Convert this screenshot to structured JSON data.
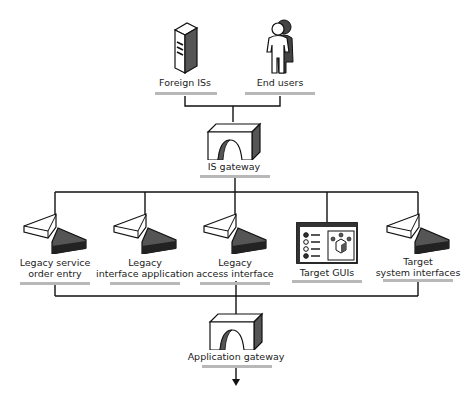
{
  "diagram": {
    "top_nodes": [
      {
        "id": "foreign-iss",
        "label": "Foreign ISs",
        "icon": "server-tower-icon"
      },
      {
        "id": "end-users",
        "label": "End users",
        "icon": "user-person-icon"
      }
    ],
    "is_gateway": {
      "label": "IS gateway",
      "icon": "gateway-arch-icon"
    },
    "middle_nodes": [
      {
        "id": "legacy-service-order-entry",
        "line1": "Legacy service",
        "line2": "order entry",
        "icon": "legacy-interface-icon"
      },
      {
        "id": "legacy-interface-application",
        "line1": "Legacy",
        "line2": "interface application",
        "icon": "legacy-interface-icon"
      },
      {
        "id": "legacy-access-interface",
        "line1": "Legacy",
        "line2": "access interface",
        "icon": "legacy-interface-icon"
      },
      {
        "id": "target-guis",
        "line1": "",
        "line2": "Target GUIs",
        "icon": "gui-window-icon"
      },
      {
        "id": "target-system-interfaces",
        "line1": "Target",
        "line2": "system interfaces",
        "icon": "target-interface-icon"
      }
    ],
    "application_gateway": {
      "label": "Application gateway",
      "icon": "gateway-arch-icon"
    },
    "colors": {
      "line": "#111111",
      "underline": "#b8b8b8",
      "dark_fill": "#555555",
      "darker_fill": "#222222"
    }
  }
}
